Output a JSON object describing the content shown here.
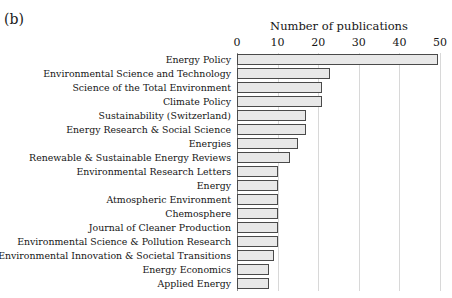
{
  "panel": {
    "label": "(b)"
  },
  "chart_data": {
    "type": "bar",
    "orientation": "horizontal",
    "title": "",
    "xlabel": "Number of publications",
    "ylabel": "",
    "xlim": [
      0,
      50
    ],
    "xticks": [
      0,
      10,
      20,
      30,
      40,
      50
    ],
    "xticklabels": [
      "0",
      "10",
      "20",
      "30",
      "40",
      "50"
    ],
    "grid": "vertical",
    "legend": "none",
    "bar_fill_color": "#e8e8e8",
    "bar_edge_color": "#4a4a4a",
    "categories": [
      "Energy Policy",
      "Environmental Science and Technology",
      "Science of the Total Environment",
      "Climate Policy",
      "Sustainability (Switzerland)",
      "Energy Research & Social Science",
      "Energies",
      "Renewable & Sustainable Energy Reviews",
      "Environmental Research Letters",
      "Energy",
      "Atmospheric Environment",
      "Chemosphere",
      "Journal of Cleaner Production",
      "Environmental Science & Pollution Research",
      "Environmental Innovation & Societal Transitions",
      "Energy Economics",
      "Applied Energy"
    ],
    "values": [
      49.5,
      23,
      21,
      21,
      17,
      17,
      15,
      13,
      10,
      10,
      10,
      10,
      10,
      10,
      9,
      8,
      8
    ]
  }
}
